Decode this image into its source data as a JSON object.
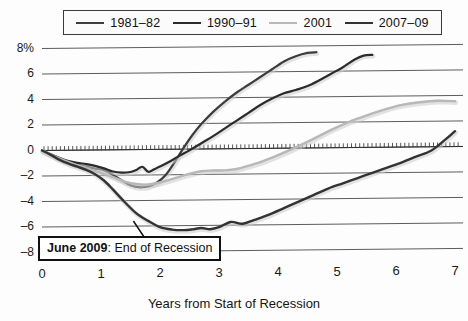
{
  "chart_data": {
    "type": "line",
    "title": "",
    "subtitle": "",
    "xlabel": "Years from Start of Recession",
    "ylabel": "",
    "xlim": [
      0,
      7
    ],
    "ylim": [
      -8,
      8
    ],
    "grid": true,
    "legend_position": "top",
    "y_unit": "%",
    "x_ticks": [
      "0",
      "1",
      "2",
      "3",
      "4",
      "5",
      "6",
      "7"
    ],
    "y_ticks": [
      "8%",
      "6",
      "4",
      "2",
      "0",
      "-2",
      "-4",
      "-6",
      "-8"
    ],
    "zero_line_style": "dotted-hatched",
    "annotations": [
      {
        "name": "end-of-recession-callout",
        "bold_text": "June 2009",
        "separator": ": ",
        "text": "End of Recession",
        "points_to_x": 1.55,
        "points_to_y": -5.6
      }
    ],
    "series": [
      {
        "name": "1981-82",
        "color": "#3d3d3d",
        "width": 2.2,
        "x": [
          0,
          0.15,
          0.3,
          0.45,
          0.6,
          0.75,
          0.9,
          1.05,
          1.2,
          1.35,
          1.5,
          1.65,
          1.8,
          1.95,
          2.1,
          2.25,
          2.4,
          2.55,
          2.7,
          2.9,
          3.1,
          3.3,
          3.5,
          3.7,
          3.9,
          4.1,
          4.3,
          4.5,
          4.65
        ],
        "y": [
          0,
          -0.35,
          -0.7,
          -0.95,
          -1.15,
          -1.3,
          -1.45,
          -1.6,
          -1.95,
          -2.4,
          -2.8,
          -2.95,
          -2.9,
          -2.6,
          -2.0,
          -1.0,
          0.1,
          1.1,
          1.95,
          2.9,
          3.7,
          4.4,
          5.0,
          5.6,
          6.2,
          6.8,
          7.2,
          7.45,
          7.5
        ]
      },
      {
        "name": "1990-91",
        "color": "#2b2b2b",
        "width": 2.2,
        "x": [
          0,
          0.15,
          0.3,
          0.45,
          0.6,
          0.75,
          0.9,
          1.05,
          1.2,
          1.35,
          1.5,
          1.6,
          1.7,
          1.8,
          1.9,
          2.0,
          2.15,
          2.3,
          2.5,
          2.7,
          2.9,
          3.1,
          3.3,
          3.5,
          3.7,
          3.9,
          4.1,
          4.3,
          4.5,
          4.7,
          4.9,
          5.1,
          5.3,
          5.45,
          5.6
        ],
        "y": [
          0,
          -0.3,
          -0.6,
          -0.85,
          -1.0,
          -1.1,
          -1.25,
          -1.45,
          -1.7,
          -1.8,
          -1.75,
          -1.6,
          -1.35,
          -1.75,
          -1.55,
          -1.35,
          -1.0,
          -0.6,
          -0.1,
          0.45,
          1.0,
          1.6,
          2.2,
          2.8,
          3.4,
          3.9,
          4.3,
          4.55,
          4.85,
          5.3,
          5.8,
          6.3,
          6.9,
          7.2,
          7.25
        ]
      },
      {
        "name": "2001",
        "color": "#b8b8b8",
        "width": 2.4,
        "x": [
          0,
          0.2,
          0.4,
          0.6,
          0.8,
          1.0,
          1.2,
          1.4,
          1.6,
          1.8,
          2.0,
          2.2,
          2.45,
          2.7,
          2.9,
          3.1,
          3.3,
          3.5,
          3.75,
          4.0,
          4.3,
          4.6,
          4.9,
          5.2,
          5.5,
          5.8,
          6.1,
          6.4,
          6.7,
          7.0
        ],
        "y": [
          0,
          -0.45,
          -0.85,
          -1.2,
          -1.5,
          -1.8,
          -2.15,
          -2.5,
          -2.7,
          -2.75,
          -2.6,
          -2.35,
          -2.0,
          -1.75,
          -1.7,
          -1.7,
          -1.6,
          -1.35,
          -1.0,
          -0.55,
          0.05,
          0.7,
          1.4,
          2.0,
          2.5,
          2.95,
          3.3,
          3.5,
          3.6,
          3.55
        ]
      },
      {
        "name": "2007-09",
        "color": "#333333",
        "width": 2.4,
        "x": [
          0,
          0.15,
          0.3,
          0.45,
          0.6,
          0.75,
          0.9,
          1.05,
          1.2,
          1.4,
          1.6,
          1.8,
          2.0,
          2.2,
          2.4,
          2.55,
          2.7,
          2.85,
          3.0,
          3.2,
          3.4,
          3.6,
          3.85,
          4.1,
          4.35,
          4.6,
          4.85,
          5.1,
          5.35,
          5.6,
          5.85,
          6.1,
          6.35,
          6.6,
          6.85,
          7.0
        ],
        "y": [
          0,
          -0.35,
          -0.75,
          -1.05,
          -1.3,
          -1.55,
          -1.9,
          -2.4,
          -3.1,
          -4.1,
          -5.0,
          -5.6,
          -6.1,
          -6.3,
          -6.35,
          -6.3,
          -6.2,
          -6.3,
          -6.15,
          -5.75,
          -5.9,
          -5.6,
          -5.2,
          -4.7,
          -4.2,
          -3.7,
          -3.2,
          -2.8,
          -2.4,
          -2.0,
          -1.6,
          -1.2,
          -0.75,
          -0.3,
          0.6,
          1.2
        ]
      }
    ]
  },
  "legend": {
    "entries": [
      {
        "label": "1981–82",
        "color": "#3d3d3d"
      },
      {
        "label": "1990–91",
        "color": "#2b2b2b"
      },
      {
        "label": "2001",
        "color": "#b8b8b8"
      },
      {
        "label": "2007–09",
        "color": "#333333"
      }
    ]
  },
  "axes": {
    "y_labels": [
      "8%",
      "6",
      "4",
      "2",
      "0",
      "–2",
      "–4",
      "–6",
      "–8"
    ],
    "x_labels": [
      "0",
      "1",
      "2",
      "3",
      "4",
      "5",
      "6",
      "7"
    ],
    "x_title": "Years from Start of Recession"
  },
  "callout": {
    "bold": "June 2009",
    "rest": ": End of Recession"
  }
}
